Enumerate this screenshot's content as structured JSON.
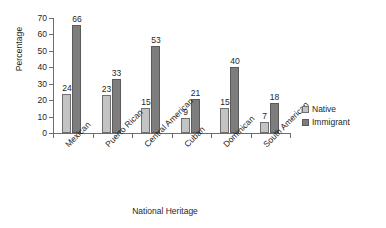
{
  "chart_data": {
    "type": "bar",
    "title": "",
    "xlabel": "National Heritage",
    "ylabel": "Percentage",
    "categories": [
      "Mexican",
      "Puerto Rican",
      "Central American",
      "Cuban",
      "Dominican",
      "South American"
    ],
    "series": [
      {
        "name": "Native",
        "values": [
          24,
          23,
          15,
          9,
          15,
          7
        ],
        "color": "#c3c3c3"
      },
      {
        "name": "Immigrant",
        "values": [
          66,
          33,
          53,
          21,
          40,
          18
        ],
        "color": "#7d7d7d"
      }
    ],
    "ylim": [
      0,
      70
    ],
    "yticks": [
      0,
      10,
      20,
      30,
      40,
      50,
      60,
      70
    ],
    "ytick_labels": [
      "0",
      "10",
      "20",
      "30",
      "40",
      "50",
      "60",
      "70"
    ],
    "grid": false,
    "legend_position": "right",
    "data_labels": true
  },
  "legend": {
    "items": [
      {
        "label": "Native"
      },
      {
        "label": "Immigrant"
      }
    ]
  }
}
